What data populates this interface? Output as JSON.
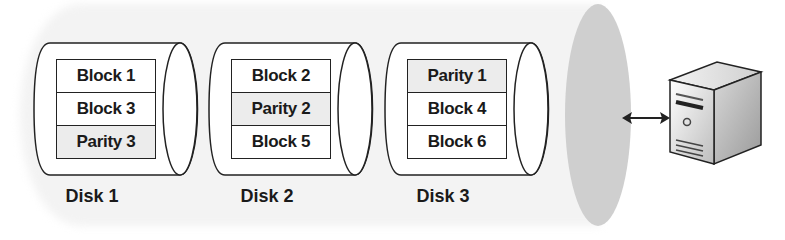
{
  "diagram": {
    "disks": [
      {
        "label": "Disk 1",
        "blocks": [
          {
            "text": "Block 1",
            "type": "data"
          },
          {
            "text": "Block 3",
            "type": "data"
          },
          {
            "text": "Parity 3",
            "type": "parity"
          }
        ]
      },
      {
        "label": "Disk 2",
        "blocks": [
          {
            "text": "Block 2",
            "type": "data"
          },
          {
            "text": "Parity 2",
            "type": "parity"
          },
          {
            "text": "Block 5",
            "type": "data"
          }
        ]
      },
      {
        "label": "Disk 3",
        "blocks": [
          {
            "text": "Parity 1",
            "type": "parity"
          },
          {
            "text": "Block 4",
            "type": "data"
          },
          {
            "text": "Block 6",
            "type": "data"
          }
        ]
      }
    ],
    "connector": "bidirectional-arrow",
    "host": "server-tower-icon",
    "colors": {
      "array_body": "#f3f3f3",
      "array_cap": "#cfcfcf",
      "parity_fill": "#ececec",
      "outline": "#222222"
    }
  }
}
